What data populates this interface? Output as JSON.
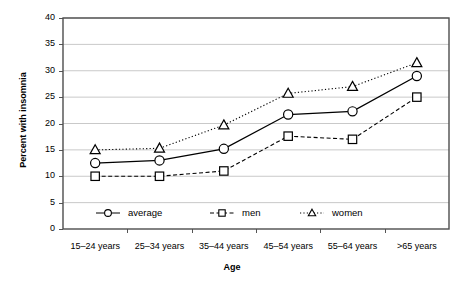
{
  "chart_data": {
    "type": "line",
    "title": "",
    "xlabel": "Age",
    "ylabel": "Percent with insomnia",
    "ylim": [
      0,
      40
    ],
    "ytick_step": 5,
    "yticks": [
      "0",
      "5",
      "10",
      "15",
      "20",
      "25",
      "30",
      "35",
      "40"
    ],
    "grid": "horizontal",
    "legend_position": "inside-bottom",
    "categories": [
      "15–24 years",
      "25–34 years",
      "35–44 years",
      "45–54 years",
      "55–64 years",
      ">65 years"
    ],
    "series": [
      {
        "name": "average",
        "marker": "circle",
        "line_style": "solid",
        "color": "#000000",
        "values": [
          12.5,
          13.0,
          15.2,
          21.7,
          22.3,
          29.0
        ]
      },
      {
        "name": "men",
        "marker": "square",
        "line_style": "dashed",
        "color": "#000000",
        "values": [
          10.0,
          10.0,
          11.0,
          17.6,
          17.0,
          25.0
        ]
      },
      {
        "name": "women",
        "marker": "triangle",
        "line_style": "dotted",
        "color": "#000000",
        "values": [
          15.0,
          15.3,
          19.7,
          25.7,
          27.0,
          31.5
        ]
      }
    ]
  },
  "legend": {
    "items": [
      {
        "label": "average"
      },
      {
        "label": "men"
      },
      {
        "label": "women"
      }
    ]
  }
}
